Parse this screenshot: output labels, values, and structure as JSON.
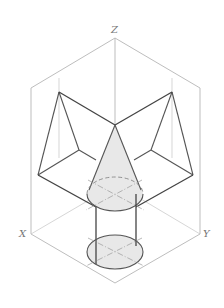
{
  "diagram": {
    "type": "isometric technical drawing",
    "axes": {
      "z_label": "Z",
      "x_label": "X",
      "y_label": "Y"
    },
    "colors": {
      "frame": "#b5b5b5",
      "edge": "#555555",
      "fill": "#e8e8e8",
      "label": "#777777"
    }
  }
}
